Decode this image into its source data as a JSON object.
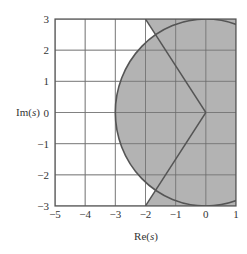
{
  "chart_data": {
    "type": "area",
    "title": "",
    "xlabel": "Re(s)",
    "ylabel": "Im(s)",
    "xlim": [
      -5,
      1
    ],
    "ylim": [
      -3,
      3
    ],
    "x_ticks": [
      "-5",
      "-4",
      "-3",
      "-2",
      "-1",
      "0",
      "1"
    ],
    "y_ticks": [
      "3",
      "2",
      "1",
      "0",
      "-1",
      "-2",
      "-3"
    ],
    "grid": true,
    "shaded_region": {
      "description": "Union of disk of radius 3 centered at origin and half-plane right of damping-ratio lines through origin",
      "circle_radius": 3,
      "damping_lines": [
        {
          "from": [
            0,
            0
          ],
          "to": [
            -2,
            3
          ]
        },
        {
          "from": [
            0,
            0
          ],
          "to": [
            -2,
            -3
          ]
        }
      ],
      "fill_color": "#b3b3b3"
    },
    "colors": {
      "grid": "#555555",
      "grid_light": "#cccccc",
      "boundary": "#555555",
      "fill": "#b3b3b3"
    }
  },
  "axes": {
    "x_label": "Re(s)",
    "y_label": "Im(s)"
  }
}
